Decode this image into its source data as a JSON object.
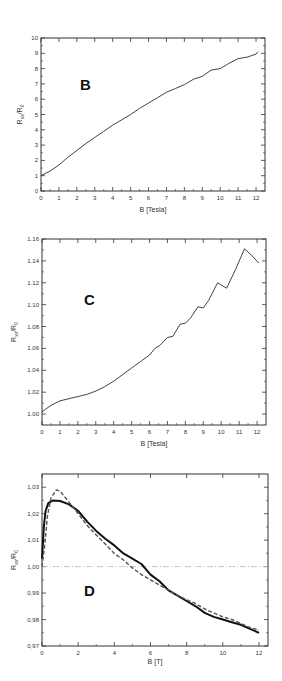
{
  "chart_data": [
    {
      "type": "line",
      "panel_label": "B",
      "xlabel": "B [Tesla]",
      "ylabel": "R_xx/R_0",
      "xlim": [
        0,
        12.5
      ],
      "ylim": [
        0,
        10
      ],
      "xticks": [
        "0",
        "1",
        "2",
        "3",
        "4",
        "5",
        "6",
        "7",
        "8",
        "9",
        "10",
        "11",
        "12"
      ],
      "yticks": [
        "0",
        "1",
        "2",
        "3",
        "4",
        "5",
        "6",
        "7",
        "8",
        "9",
        "10"
      ],
      "grid": false,
      "series": [
        {
          "name": "R_xx/R_0",
          "style": "solid-thin",
          "x": [
            0,
            0.5,
            1,
            1.5,
            2,
            2.5,
            3,
            3.5,
            4,
            4.5,
            5,
            5.5,
            6,
            6.5,
            7,
            7.5,
            8,
            8.5,
            9,
            9.5,
            10,
            10.5,
            11,
            11.5,
            12,
            12.1
          ],
          "y": [
            1.0,
            1.3,
            1.7,
            2.2,
            2.65,
            3.1,
            3.5,
            3.9,
            4.3,
            4.65,
            5.0,
            5.4,
            5.75,
            6.1,
            6.45,
            6.7,
            6.95,
            7.3,
            7.5,
            7.9,
            8.0,
            8.35,
            8.65,
            8.75,
            8.95,
            9.1
          ]
        }
      ]
    },
    {
      "type": "line",
      "panel_label": "C",
      "xlabel": "B [Tesla]",
      "ylabel": "R_xx/R_0",
      "xlim": [
        0,
        12.5
      ],
      "ylim": [
        0.99,
        1.16
      ],
      "xticks": [
        "0",
        "1",
        "2",
        "3",
        "4",
        "5",
        "6",
        "7",
        "8",
        "9",
        "10",
        "11",
        "12"
      ],
      "yticks": [
        "1.00",
        "1.02",
        "1.04",
        "1.06",
        "1.08",
        "1.10",
        "1.12",
        "1.14",
        "1.16"
      ],
      "grid": false,
      "series": [
        {
          "name": "R_xx/R_0",
          "style": "solid-thin",
          "x": [
            0,
            0.5,
            1,
            1.5,
            2,
            2.5,
            3,
            3.5,
            4,
            4.5,
            5,
            5.5,
            6,
            6.3,
            6.6,
            7,
            7.3,
            7.7,
            8,
            8.3,
            8.7,
            9,
            9.3,
            9.8,
            10.3,
            10.8,
            11.3,
            11.7,
            12.1
          ],
          "y": [
            1.002,
            1.008,
            1.012,
            1.014,
            1.016,
            1.018,
            1.021,
            1.025,
            1.03,
            1.036,
            1.042,
            1.048,
            1.054,
            1.06,
            1.063,
            1.07,
            1.071,
            1.082,
            1.083,
            1.088,
            1.098,
            1.097,
            1.104,
            1.12,
            1.115,
            1.132,
            1.151,
            1.145,
            1.138
          ]
        }
      ]
    },
    {
      "type": "line",
      "panel_label": "D",
      "xlabel": "B [T]",
      "ylabel": "R_xx/R_0",
      "xlim": [
        0,
        12.5
      ],
      "ylim": [
        0.97,
        1.035
      ],
      "xticks": [
        "0",
        "2",
        "4",
        "6",
        "8",
        "10",
        "12"
      ],
      "yticks": [
        "0,97",
        "0,98",
        "0,99",
        "1,00",
        "1,01",
        "1,02",
        "1,03"
      ],
      "grid": false,
      "reference_line": {
        "y": 1.0,
        "style": "dash-dot",
        "color": "#bbbbbb"
      },
      "series": [
        {
          "name": "measured",
          "style": "solid-thick",
          "x": [
            0,
            0.1,
            0.2,
            0.35,
            0.6,
            1.0,
            1.5,
            2,
            2.5,
            3,
            3.5,
            4,
            4.5,
            5,
            5.5,
            6,
            6.5,
            7,
            7.5,
            8,
            8.5,
            9,
            9.5,
            10,
            10.5,
            11,
            11.5,
            12
          ],
          "y": [
            1.003,
            1.015,
            1.021,
            1.024,
            1.025,
            1.0248,
            1.0235,
            1.021,
            1.017,
            1.0135,
            1.0105,
            1.008,
            1.005,
            1.003,
            1.001,
            0.997,
            0.9945,
            0.991,
            0.989,
            0.987,
            0.985,
            0.9825,
            0.981,
            0.98,
            0.979,
            0.978,
            0.9765,
            0.975
          ]
        },
        {
          "name": "fit",
          "style": "dashed-thick",
          "x": [
            0,
            0.15,
            0.3,
            0.5,
            0.8,
            1.0,
            1.3,
            1.6,
            2,
            2.5,
            3,
            3.5,
            4,
            4.5,
            5,
            5.5,
            6,
            6.5,
            7,
            7.5,
            8,
            8.5,
            9,
            9.5,
            10,
            10.5,
            11,
            11.5,
            12
          ],
          "y": [
            1.0,
            1.008,
            1.019,
            1.026,
            1.029,
            1.0285,
            1.026,
            1.0235,
            1.02,
            1.0155,
            1.012,
            1.0085,
            1.005,
            1.0025,
            0.9995,
            0.997,
            0.995,
            0.993,
            0.991,
            0.989,
            0.9875,
            0.986,
            0.984,
            0.9825,
            0.981,
            0.98,
            0.9785,
            0.977,
            0.976
          ]
        }
      ]
    }
  ]
}
